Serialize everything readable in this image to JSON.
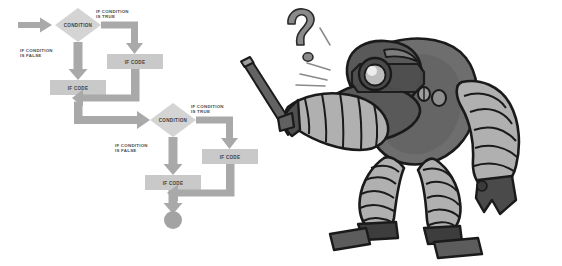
{
  "illustration": {
    "title": "If/Else Flowchart With Confused Robot",
    "background_color": "#ffffff"
  },
  "palette": {
    "arrow_gray": "#a9a9a9",
    "arrow_gray_dark": "#9b9b9b",
    "box_fill": "#c9c9c9",
    "diamond_fill": "#d4d4d4",
    "terminator_fill": "#a3a3a3",
    "label_text": "#4a4a4a",
    "node_text": "#3f3f3f",
    "robot_dark": "#595959",
    "robot_mid": "#6e6e6e",
    "robot_light": "#b0b0b0",
    "robot_outline": "#1a1a1a",
    "robot_shadow": "#3d3d3d",
    "question_fill": "#8a8a8a",
    "eye_highlight": "#e8e8e8"
  },
  "flowcharts": [
    {
      "name": "upper-flowchart",
      "entry_arrow": "entry",
      "decision": {
        "label": "CONDITION"
      },
      "true_branch": {
        "edge_label": "IF CONDITION\nIS TRUE",
        "edge_label_line1": "IF CONDITION",
        "edge_label_line2": "IS TRUE",
        "node_label": "IF CODE"
      },
      "false_branch": {
        "edge_label_line1": "IF CONDITION",
        "edge_label_line2": "IS FALSE",
        "node_label": "IF CODE"
      }
    },
    {
      "name": "lower-flowchart",
      "decision": {
        "label": "CONDITION"
      },
      "true_branch": {
        "edge_label_line1": "IF CONDITION",
        "edge_label_line2": "IS TRUE",
        "node_label": "IF CODE"
      },
      "false_branch": {
        "edge_label_line1": "IF CONDITION",
        "edge_label_line2": "IS FALSE",
        "node_label": "IF CODE"
      },
      "terminator": "end-node"
    }
  ],
  "robot": {
    "name": "confused-robot",
    "thought": "?",
    "holding": "pointer-stick",
    "features": [
      "single-eye-lens",
      "segmented-arms",
      "segmented-legs",
      "heavy-boots",
      "question-mark",
      "emphasis-lines"
    ]
  }
}
